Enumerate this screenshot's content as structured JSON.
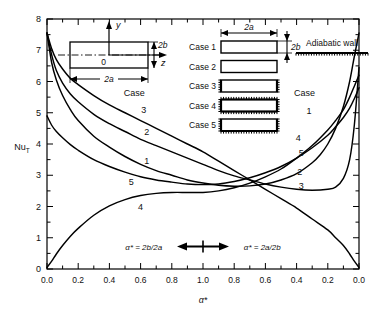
{
  "chart_data": {
    "type": "line",
    "title": "",
    "xlabel": "α*",
    "ylabel": "Nu_T",
    "ylim": [
      0,
      8
    ],
    "xlim": [
      0,
      2
    ],
    "grid": false,
    "legend_position": "inline-curve-labels",
    "x_tick_labels": [
      "0.0",
      "0.2",
      "0.4",
      "0.6",
      "0.8",
      "1.0",
      "0.8",
      "0.6",
      "0.4",
      "0.2",
      "0.0"
    ],
    "x_tick_values": [
      0.0,
      0.2,
      0.4,
      0.6,
      0.8,
      1.0,
      1.2,
      1.4,
      1.6,
      1.8,
      2.0
    ],
    "y_tick_labels": [
      "0",
      "1",
      "2",
      "3",
      "4",
      "5",
      "6",
      "7",
      "8"
    ],
    "y_tick_values": [
      0,
      1,
      2,
      3,
      4,
      5,
      6,
      7,
      8
    ],
    "y_minor_step": 0.5,
    "x_minor_step": 0.1,
    "axis_note_left": "α* = 2b/2a",
    "axis_note_right": "α* = 2a/2b",
    "series": [
      {
        "name": "Case 1",
        "label": "1",
        "points": [
          [
            0.0,
            7.55
          ],
          [
            0.03,
            6.6
          ],
          [
            0.06,
            6.05
          ],
          [
            0.1,
            5.55
          ],
          [
            0.15,
            5.1
          ],
          [
            0.2,
            4.75
          ],
          [
            0.3,
            4.25
          ],
          [
            0.4,
            3.9
          ],
          [
            0.5,
            3.6
          ],
          [
            0.6,
            3.35
          ],
          [
            0.7,
            3.15
          ],
          [
            0.8,
            3.0
          ],
          [
            0.9,
            2.85
          ],
          [
            1.0,
            2.75
          ],
          [
            1.1,
            2.68
          ],
          [
            1.2,
            2.65
          ],
          [
            1.3,
            2.66
          ],
          [
            1.4,
            2.72
          ],
          [
            1.5,
            2.85
          ],
          [
            1.6,
            3.05
          ],
          [
            1.7,
            3.4
          ],
          [
            1.75,
            3.65
          ],
          [
            1.8,
            4.0
          ],
          [
            1.85,
            4.5
          ],
          [
            1.9,
            5.2
          ],
          [
            1.94,
            6.0
          ],
          [
            1.97,
            6.8
          ],
          [
            2.0,
            7.55
          ]
        ]
      },
      {
        "name": "Case 2",
        "label": "2",
        "points": [
          [
            0.0,
            7.55
          ],
          [
            0.03,
            6.85
          ],
          [
            0.06,
            6.35
          ],
          [
            0.1,
            5.95
          ],
          [
            0.15,
            5.6
          ],
          [
            0.2,
            5.35
          ],
          [
            0.3,
            4.95
          ],
          [
            0.4,
            4.65
          ],
          [
            0.5,
            4.4
          ],
          [
            0.6,
            4.15
          ],
          [
            0.7,
            3.95
          ],
          [
            0.8,
            3.75
          ],
          [
            0.9,
            3.55
          ],
          [
            1.0,
            3.35
          ],
          [
            1.1,
            3.15
          ],
          [
            1.2,
            2.98
          ],
          [
            1.3,
            2.85
          ],
          [
            1.4,
            2.72
          ],
          [
            1.5,
            2.62
          ],
          [
            1.6,
            2.55
          ],
          [
            1.7,
            2.52
          ],
          [
            1.8,
            2.55
          ],
          [
            1.85,
            2.62
          ],
          [
            1.9,
            2.9
          ],
          [
            1.94,
            3.5
          ],
          [
            1.97,
            4.6
          ],
          [
            2.0,
            6.45
          ]
        ]
      },
      {
        "name": "Case 3",
        "label": "3",
        "points": [
          [
            0.0,
            7.55
          ],
          [
            0.03,
            7.05
          ],
          [
            0.06,
            6.7
          ],
          [
            0.1,
            6.4
          ],
          [
            0.15,
            6.1
          ],
          [
            0.2,
            5.9
          ],
          [
            0.3,
            5.55
          ],
          [
            0.4,
            5.25
          ],
          [
            0.5,
            5.0
          ],
          [
            0.6,
            4.75
          ],
          [
            0.7,
            4.5
          ],
          [
            0.8,
            4.25
          ],
          [
            0.9,
            4.0
          ],
          [
            1.0,
            3.75
          ],
          [
            1.1,
            3.45
          ],
          [
            1.2,
            3.15
          ],
          [
            1.3,
            2.85
          ],
          [
            1.4,
            2.55
          ],
          [
            1.5,
            2.25
          ],
          [
            1.6,
            1.95
          ],
          [
            1.7,
            1.6
          ],
          [
            1.8,
            1.25
          ],
          [
            1.85,
            1.0
          ],
          [
            1.9,
            0.75
          ],
          [
            1.94,
            0.48
          ],
          [
            1.97,
            0.25
          ],
          [
            2.0,
            0.05
          ]
        ]
      },
      {
        "name": "Case 4",
        "label": "4",
        "points": [
          [
            0.0,
            0.05
          ],
          [
            0.03,
            0.25
          ],
          [
            0.06,
            0.48
          ],
          [
            0.1,
            0.75
          ],
          [
            0.15,
            1.05
          ],
          [
            0.2,
            1.3
          ],
          [
            0.3,
            1.72
          ],
          [
            0.4,
            2.02
          ],
          [
            0.5,
            2.22
          ],
          [
            0.6,
            2.35
          ],
          [
            0.7,
            2.42
          ],
          [
            0.8,
            2.45
          ],
          [
            0.9,
            2.45
          ],
          [
            1.0,
            2.45
          ],
          [
            1.1,
            2.5
          ],
          [
            1.2,
            2.6
          ],
          [
            1.3,
            2.75
          ],
          [
            1.4,
            2.95
          ],
          [
            1.5,
            3.2
          ],
          [
            1.6,
            3.55
          ],
          [
            1.7,
            3.95
          ],
          [
            1.8,
            4.45
          ],
          [
            1.85,
            4.75
          ],
          [
            1.9,
            5.1
          ],
          [
            1.94,
            5.5
          ],
          [
            1.97,
            5.85
          ],
          [
            2.0,
            6.2
          ]
        ]
      },
      {
        "name": "Case 5",
        "label": "5",
        "points": [
          [
            0.0,
            4.9
          ],
          [
            0.03,
            4.6
          ],
          [
            0.06,
            4.4
          ],
          [
            0.1,
            4.2
          ],
          [
            0.15,
            3.98
          ],
          [
            0.2,
            3.8
          ],
          [
            0.3,
            3.5
          ],
          [
            0.4,
            3.28
          ],
          [
            0.5,
            3.1
          ],
          [
            0.6,
            2.95
          ],
          [
            0.7,
            2.85
          ],
          [
            0.8,
            2.78
          ],
          [
            0.9,
            2.72
          ],
          [
            1.0,
            2.7
          ],
          [
            1.1,
            2.72
          ],
          [
            1.2,
            2.8
          ],
          [
            1.3,
            2.92
          ],
          [
            1.4,
            3.08
          ],
          [
            1.5,
            3.28
          ],
          [
            1.6,
            3.55
          ],
          [
            1.7,
            3.88
          ],
          [
            1.8,
            4.28
          ],
          [
            1.85,
            4.55
          ],
          [
            1.9,
            4.85
          ],
          [
            1.94,
            5.15
          ],
          [
            1.97,
            5.45
          ],
          [
            2.0,
            5.8
          ]
        ]
      }
    ],
    "left_curve_labels": [
      {
        "text": "Case",
        "x": 0.56,
        "y": 5.55
      },
      {
        "text": "3",
        "x": 0.62,
        "y": 5.0
      },
      {
        "text": "2",
        "x": 0.64,
        "y": 4.3
      },
      {
        "text": "1",
        "x": 0.64,
        "y": 3.35
      },
      {
        "text": "5",
        "x": 0.54,
        "y": 2.7
      },
      {
        "text": "4",
        "x": 0.6,
        "y": 1.9
      }
    ],
    "right_curve_labels": [
      {
        "text": "Case",
        "x": 1.65,
        "y": 5.55
      },
      {
        "text": "1",
        "x": 1.68,
        "y": 4.95
      },
      {
        "text": "4",
        "x": 1.61,
        "y": 4.1
      },
      {
        "text": "5",
        "x": 1.63,
        "y": 3.62
      },
      {
        "text": "2",
        "x": 1.62,
        "y": 3.0
      },
      {
        "text": "3",
        "x": 1.63,
        "y": 2.55
      }
    ]
  },
  "inset_duct": {
    "label_y": "y",
    "label_z": "z",
    "label_origin": "0",
    "label_width": "2a",
    "label_height": "2b"
  },
  "case_legend": {
    "dim_top_label": "2a",
    "dim_side_label": "2b",
    "adiabatic_label": "Adiabatic wall",
    "items": [
      {
        "label": "Case 1",
        "walls": "none"
      },
      {
        "label": "Case 2",
        "walls": "none"
      },
      {
        "label": "Case 3",
        "walls": "sides"
      },
      {
        "label": "Case 4",
        "walls": "all"
      },
      {
        "label": "Case 5",
        "walls": "bottom"
      }
    ]
  },
  "colors": {
    "axis": "#000000",
    "curve": "#000000",
    "text": "#111111",
    "background": "#ffffff"
  }
}
